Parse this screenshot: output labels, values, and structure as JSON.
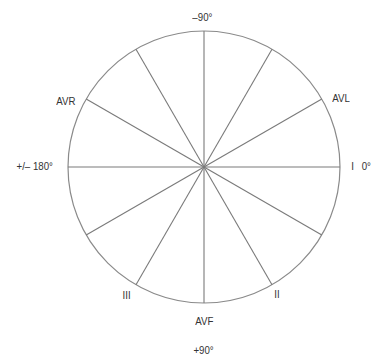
{
  "colors": {
    "line": "#7a7a7a",
    "circle": "#8a8a8a",
    "text": "#333333",
    "background": "#ffffff"
  },
  "geometry": {
    "center": [
      204,
      167
    ],
    "radius": 136,
    "spoke_angles_deg": [
      0,
      30,
      60,
      90,
      120,
      150,
      180,
      210,
      240,
      270,
      300,
      330
    ]
  },
  "labels": {
    "top_angle": "–90°",
    "left_angle": "+/– 180°",
    "right_lead": "I",
    "right_angle": "0°",
    "avr": "AVR",
    "avl": "AVL",
    "lead_iii": "III",
    "lead_ii": "II",
    "avf": "AVF",
    "bottom_angle": "+90°"
  }
}
